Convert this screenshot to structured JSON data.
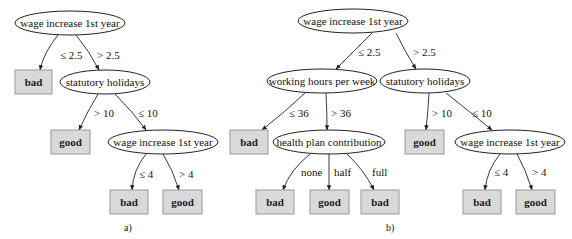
{
  "colors": {
    "leaf_fill": "#d9d9d9",
    "leaf_stroke": "#999999",
    "line": "#222222"
  },
  "trees": [
    {
      "caption": "a)",
      "nodes": [
        {
          "id": "a1",
          "type": "decision",
          "label": "wage increase 1st year",
          "cx": 70,
          "cy": 23,
          "rx": 55,
          "ry": 12
        },
        {
          "id": "a2",
          "type": "leaf",
          "label": "bad",
          "x": 15,
          "y": 70,
          "w": 37,
          "h": 24
        },
        {
          "id": "a3",
          "type": "decision",
          "label": "statutory holidays",
          "cx": 105,
          "cy": 82,
          "rx": 45,
          "ry": 12
        },
        {
          "id": "a4",
          "type": "leaf",
          "label": "good",
          "x": 51,
          "y": 130,
          "w": 39,
          "h": 24
        },
        {
          "id": "a5",
          "type": "decision",
          "label": "wage increase 1st year",
          "cx": 163,
          "cy": 142,
          "rx": 55,
          "ry": 12
        },
        {
          "id": "a6",
          "type": "leaf",
          "label": "bad",
          "x": 110,
          "y": 190,
          "w": 38,
          "h": 24
        },
        {
          "id": "a7",
          "type": "leaf",
          "label": "good",
          "x": 163,
          "y": 190,
          "w": 39,
          "h": 24
        }
      ],
      "edges": [
        {
          "from": "a1",
          "to": "a2",
          "label": "≤ 2.5",
          "path": "M58,35 Q44,52 40,70",
          "lx": 60,
          "ly": 59
        },
        {
          "from": "a1",
          "to": "a3",
          "label": "> 2.5",
          "path": "M76,35 Q90,52 99,70",
          "lx": 97,
          "ly": 59
        },
        {
          "from": "a3",
          "to": "a4",
          "label": "> 10",
          "path": "M98,94 Q87,112 79,130",
          "lx": 94,
          "ly": 117
        },
        {
          "from": "a3",
          "to": "a5",
          "label": "≤ 10",
          "path": "M115,94 Q133,112 146,130",
          "lx": 138,
          "ly": 117
        },
        {
          "from": "a5",
          "to": "a6",
          "label": "≤ 4",
          "path": "M146,154 Q133,170 132,190",
          "lx": 139,
          "ly": 178
        },
        {
          "from": "a5",
          "to": "a7",
          "label": "> 4",
          "path": "M163,154 Q173,170 179,190",
          "lx": 179,
          "ly": 178
        }
      ],
      "caption_pos": {
        "x": 124,
        "y": 231
      }
    },
    {
      "caption": "b)",
      "nodes": [
        {
          "id": "b1",
          "type": "decision",
          "label": "wage increase 1st year",
          "cx": 353,
          "cy": 21,
          "rx": 55,
          "ry": 12
        },
        {
          "id": "b2",
          "type": "decision",
          "label": "working hours per week",
          "cx": 322,
          "cy": 81,
          "rx": 55,
          "ry": 12
        },
        {
          "id": "b3",
          "type": "decision",
          "label": "statutory holidays",
          "cx": 425,
          "cy": 81,
          "rx": 45,
          "ry": 12
        },
        {
          "id": "b4",
          "type": "leaf",
          "label": "bad",
          "x": 230,
          "y": 130,
          "w": 38,
          "h": 24
        },
        {
          "id": "b5",
          "type": "decision",
          "label": "health plan contribution",
          "cx": 329,
          "cy": 142,
          "rx": 56,
          "ry": 12
        },
        {
          "id": "b6",
          "type": "leaf",
          "label": "good",
          "x": 405,
          "y": 130,
          "w": 39,
          "h": 24
        },
        {
          "id": "b7",
          "type": "decision",
          "label": "wage increase 1st year",
          "cx": 510,
          "cy": 142,
          "rx": 55,
          "ry": 12
        },
        {
          "id": "b8",
          "type": "leaf",
          "label": "bad",
          "x": 256,
          "y": 190,
          "w": 38,
          "h": 24
        },
        {
          "id": "b9",
          "type": "leaf",
          "label": "good",
          "x": 310,
          "y": 190,
          "w": 39,
          "h": 24
        },
        {
          "id": "b10",
          "type": "leaf",
          "label": "bad",
          "x": 361,
          "y": 190,
          "w": 38,
          "h": 24
        },
        {
          "id": "b11",
          "type": "leaf",
          "label": "bad",
          "x": 463,
          "y": 190,
          "w": 38,
          "h": 24
        },
        {
          "id": "b12",
          "type": "leaf",
          "label": "good",
          "x": 516,
          "y": 190,
          "w": 39,
          "h": 24
        }
      ],
      "edges": [
        {
          "from": "b1",
          "to": "b2",
          "label": "≤ 2.5",
          "path": "M372,33 Q353,52 336,69",
          "lx": 358,
          "ly": 56
        },
        {
          "from": "b1",
          "to": "b3",
          "label": "> 2.5",
          "path": "M396,33 Q404,50 416,69",
          "lx": 413,
          "ly": 56
        },
        {
          "from": "b2",
          "to": "b4",
          "label": "≤ 36",
          "path": "M305,93 Q285,112 262,130",
          "lx": 289,
          "ly": 117
        },
        {
          "from": "b2",
          "to": "b5",
          "label": "> 36",
          "path": "M326,93 Q327,112 327,130",
          "lx": 331,
          "ly": 117
        },
        {
          "from": "b3",
          "to": "b6",
          "label": "> 10",
          "path": "M429,93 Q428,112 426,130",
          "lx": 432,
          "ly": 117
        },
        {
          "from": "b3",
          "to": "b7",
          "label": "≤ 10",
          "path": "M446,93 Q470,112 492,130",
          "lx": 472,
          "ly": 117
        },
        {
          "from": "b5",
          "to": "b8",
          "label": "none",
          "path": "M310,154 Q290,170 283,190",
          "lx": 301,
          "ly": 176
        },
        {
          "from": "b5",
          "to": "b9",
          "label": "half",
          "path": "M329,154 L329,190",
          "lx": 334,
          "ly": 176
        },
        {
          "from": "b5",
          "to": "b10",
          "label": "full",
          "path": "M347,154 Q364,170 374,190",
          "lx": 372,
          "ly": 176
        },
        {
          "from": "b7",
          "to": "b11",
          "label": "≤ 4",
          "path": "M500,154 Q487,170 485,190",
          "lx": 494,
          "ly": 176
        },
        {
          "from": "b7",
          "to": "b12",
          "label": "> 4",
          "path": "M517,154 Q526,170 532,190",
          "lx": 532,
          "ly": 176
        }
      ],
      "caption_pos": {
        "x": 386,
        "y": 231
      }
    }
  ]
}
